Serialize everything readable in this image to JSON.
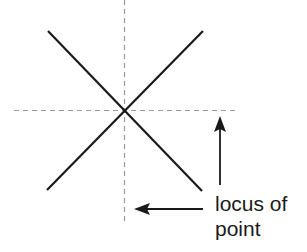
{
  "diagram": {
    "label_line1": "locus of",
    "label_line2": "point",
    "colors": {
      "background": "#ffffff",
      "line": "#1a1a1a",
      "dashed": "#9a9a9a"
    }
  }
}
